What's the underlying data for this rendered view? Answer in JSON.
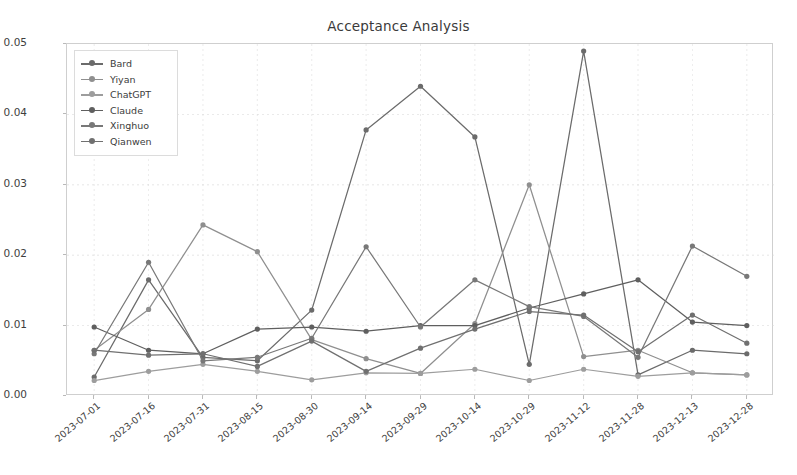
{
  "chart_data": {
    "type": "line",
    "title": "Acceptance Analysis",
    "xlabel": "",
    "ylabel": "Acceptance",
    "ylim": [
      0.0,
      0.05
    ],
    "yticks": [
      "0.00",
      "0.01",
      "0.02",
      "0.03",
      "0.04",
      "0.05"
    ],
    "ytick_values": [
      0.0,
      0.01,
      0.02,
      0.03,
      0.04,
      0.05
    ],
    "grid": true,
    "legend_position": "upper left",
    "categories": [
      "2023-07-01",
      "2023-07-16",
      "2023-07-31",
      "2023-08-15",
      "2023-08-30",
      "2023-09-14",
      "2023-09-29",
      "2023-10-14",
      "2023-10-29",
      "2023-11-12",
      "2023-11-28",
      "2023-12-13",
      "2023-12-28"
    ],
    "series": [
      {
        "name": "Bard",
        "color": "#6b6b6b",
        "values": [
          0.0027,
          0.0165,
          0.0055,
          0.005,
          0.0122,
          0.0378,
          0.044,
          0.0368,
          0.0045,
          0.049,
          0.003,
          0.0065,
          0.006
        ]
      },
      {
        "name": "Yiyan",
        "color": "#8f8f8f",
        "values": [
          0.0065,
          0.0123,
          0.0243,
          0.0205,
          0.008,
          0.0053,
          0.0032,
          0.0103,
          0.03,
          0.0056,
          0.0065,
          0.0033,
          0.003
        ]
      },
      {
        "name": "ChatGPT",
        "color": "#9d9d9d",
        "values": [
          0.0022,
          0.0035,
          0.0045,
          0.0035,
          0.0023,
          0.0033,
          0.0032,
          0.0038,
          0.0022,
          0.0038,
          0.0028,
          0.0033,
          0.003
        ]
      },
      {
        "name": "Claude",
        "color": "#5f5f5f",
        "values": [
          0.0098,
          0.0065,
          0.006,
          0.0095,
          0.0098,
          0.0092,
          0.01,
          0.01,
          0.0125,
          0.0145,
          0.0165,
          0.0105,
          0.01
        ]
      },
      {
        "name": "Xinghuo",
        "color": "#787878",
        "values": [
          0.006,
          0.019,
          0.005,
          0.0055,
          0.0082,
          0.0212,
          0.0098,
          0.0165,
          0.0127,
          0.0113,
          0.0055,
          0.0213,
          0.017
        ]
      },
      {
        "name": "Qianwen",
        "color": "#707070",
        "values": [
          0.0065,
          0.0058,
          0.006,
          0.0042,
          0.0078,
          0.0035,
          0.0068,
          0.0095,
          0.012,
          0.0115,
          0.0063,
          0.0115,
          0.0075
        ]
      }
    ]
  },
  "style": {
    "axis_color": "#cfcfcf",
    "grid_color": "#d8d8d8",
    "text_color": "#3e3e3e",
    "background": "#ffffff"
  }
}
